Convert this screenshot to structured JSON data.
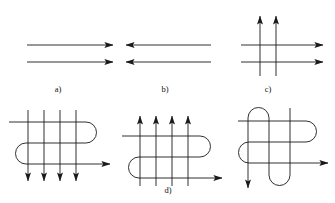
{
  "figure": {
    "canvas": {
      "width": 335,
      "height": 203,
      "background": "#ffffff"
    },
    "line_color": "#1a1a1a",
    "label_color": "#111111",
    "panels": [
      {
        "id": "a",
        "label": "a)",
        "label_x": 58,
        "label_y": 92,
        "description": "two parallel horizontal lines, both arrows pointing right",
        "arrow_directions": [
          "right",
          "right"
        ],
        "line_count": 2,
        "kind": "parallel-lines"
      },
      {
        "id": "b",
        "label": "b)",
        "label_x": 165,
        "label_y": 92,
        "description": "two parallel horizontal lines, both arrows pointing left",
        "arrow_directions": [
          "left",
          "left"
        ],
        "line_count": 2,
        "kind": "parallel-lines"
      },
      {
        "id": "c",
        "label": "c)",
        "label_x": 268,
        "label_y": 92,
        "description": "two vertical lines with up arrows crossing two horizontal lines with right arrows",
        "arrow_directions": [
          "up",
          "up",
          "right",
          "right"
        ],
        "line_count": 4,
        "kind": "crossing-grid"
      },
      {
        "id": "d",
        "label": "d)",
        "label_x": 168,
        "label_y": 192,
        "description": "meander curve crossed by four vertical lines with up arrows",
        "arrow_directions": [
          "up",
          "up",
          "up",
          "up",
          "right"
        ],
        "line_count": 5,
        "kind": "meander-with-verticals"
      },
      {
        "id": "e",
        "label": "",
        "label_x": 0,
        "label_y": 0,
        "description": "meander curve crossed by four vertical lines with down arrows",
        "arrow_directions": [
          "down",
          "down",
          "down",
          "down",
          "right"
        ],
        "line_count": 5,
        "kind": "meander-with-verticals"
      },
      {
        "id": "f",
        "label": "",
        "label_x": 0,
        "label_y": 0,
        "description": "two interwoven meander curves crossing each other, one exiting right with arrow, one exiting down with arrow",
        "arrow_directions": [
          "down",
          "right"
        ],
        "line_count": 2,
        "kind": "interwoven-meanders"
      }
    ]
  }
}
